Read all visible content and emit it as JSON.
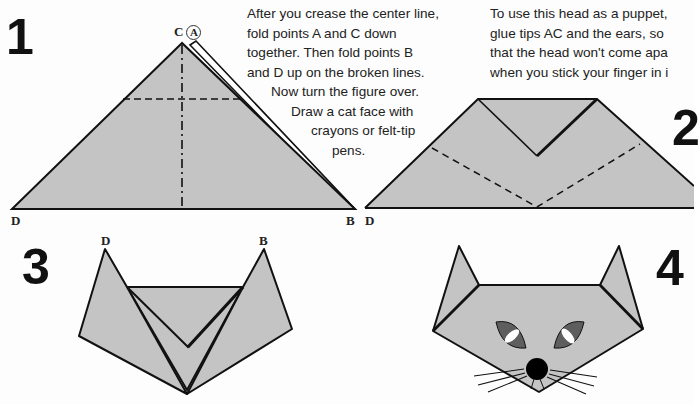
{
  "steps": [
    {
      "number": "1"
    },
    {
      "number": "2"
    },
    {
      "number": "3"
    },
    {
      "number": "4"
    }
  ],
  "labels": {
    "step1": {
      "C": "C",
      "A": "A",
      "D": "D",
      "B": "B"
    },
    "step2": {
      "D": "D"
    },
    "step3": {
      "D": "D",
      "B": "B"
    }
  },
  "instructions": {
    "fold": [
      "After you crease the center line,",
      "fold points A and C down",
      "together. Then fold points B",
      "and D up on the broken lines.",
      "Now turn the figure over.",
      "Draw a cat face with",
      "crayons or felt-tip",
      "pens."
    ],
    "puppet": [
      "To use this head as a puppet,",
      "glue tips AC and the ears, so",
      "that the head won't come apa",
      "when you stick your finger in i"
    ]
  },
  "colors": {
    "paper_fill": "#c4c4c4",
    "line": "#111111",
    "eye_fill": "#5e5e5e",
    "pupil": "#ffffff",
    "nose": "#000000"
  }
}
